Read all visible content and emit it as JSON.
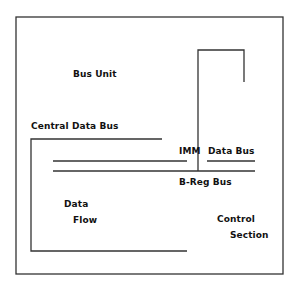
{
  "diagram": {
    "labels": {
      "bus_unit": "Bus Unit",
      "central_data_bus": "Central Data Bus",
      "imm": "IMM",
      "data_bus": "Data Bus",
      "b_reg_bus": "B-Reg Bus",
      "data": "Data",
      "flow": "Flow",
      "control": "Control",
      "section": "Section"
    },
    "colors": {
      "line": "#333333",
      "text": "#111111",
      "background": "#ffffff"
    }
  }
}
